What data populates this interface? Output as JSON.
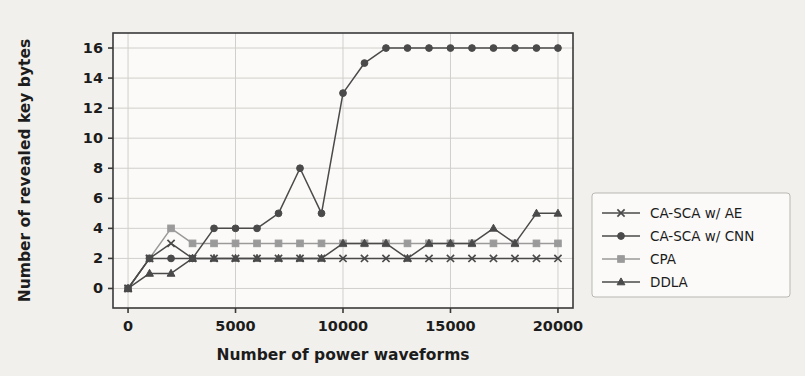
{
  "figure": {
    "background_color": "#f2f0ec",
    "plot_background_color": "#fbfaf8",
    "frame_color": "#3a3a3a",
    "grid_color": "#d0cfcb"
  },
  "chart_data": {
    "type": "line",
    "title": "",
    "xlabel": "Number of power waveforms",
    "ylabel": "Number of revealed key bytes",
    "xlim": [
      -700,
      20700
    ],
    "ylim": [
      -1.3,
      17.0
    ],
    "xticks": [
      0,
      5000,
      10000,
      15000,
      20000
    ],
    "xtick_labels": [
      "0",
      "5000",
      "10000",
      "15000",
      "20000"
    ],
    "yticks": [
      0,
      2,
      4,
      6,
      8,
      10,
      12,
      14,
      16
    ],
    "ytick_labels": [
      "0",
      "2",
      "4",
      "6",
      "8",
      "10",
      "12",
      "14",
      "16"
    ],
    "grid": true,
    "legend_position": "right-outside",
    "x": [
      0,
      1000,
      2000,
      3000,
      4000,
      5000,
      6000,
      7000,
      8000,
      9000,
      10000,
      11000,
      12000,
      13000,
      14000,
      15000,
      16000,
      17000,
      18000,
      19000,
      20000
    ],
    "series": [
      {
        "name": "CA-SCA w/ AE",
        "color": "#4a4a4a",
        "marker": "x",
        "values": [
          0,
          2,
          3,
          2,
          2,
          2,
          2,
          2,
          2,
          2,
          2,
          2,
          2,
          2,
          2,
          2,
          2,
          2,
          2,
          2,
          2
        ]
      },
      {
        "name": "CA-SCA w/ CNN",
        "color": "#4a4a4a",
        "marker": "circle",
        "values": [
          0,
          2,
          2,
          2,
          4,
          4,
          4,
          5,
          8,
          5,
          13,
          15,
          16,
          16,
          16,
          16,
          16,
          16,
          16,
          16,
          16
        ]
      },
      {
        "name": "CPA",
        "color": "#9a9a9a",
        "marker": "square",
        "values": [
          0,
          2,
          4,
          3,
          3,
          3,
          3,
          3,
          3,
          3,
          3,
          3,
          3,
          3,
          3,
          3,
          3,
          3,
          3,
          3,
          3
        ]
      },
      {
        "name": "DDLA",
        "color": "#4a4a4a",
        "marker": "triangle",
        "values": [
          0,
          1,
          1,
          2,
          2,
          2,
          2,
          2,
          2,
          2,
          3,
          3,
          3,
          2,
          3,
          3,
          3,
          4,
          3,
          5,
          5
        ]
      }
    ],
    "legend_entries": [
      {
        "label": "CA-SCA w/ AE",
        "color": "#4a4a4a",
        "marker": "x"
      },
      {
        "label": "CA-SCA w/ CNN",
        "color": "#4a4a4a",
        "marker": "circle"
      },
      {
        "label": "CPA",
        "color": "#9a9a9a",
        "marker": "square"
      },
      {
        "label": "DDLA",
        "color": "#4a4a4a",
        "marker": "triangle"
      }
    ]
  }
}
